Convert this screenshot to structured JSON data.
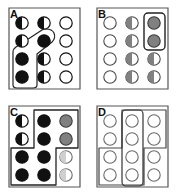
{
  "figure": {
    "width": 176,
    "height": 195,
    "background_color": "#ffffff",
    "panel_count": 4,
    "grid": {
      "rows": 4,
      "cols": 3,
      "circle_radius": 6.2,
      "col_x": [
        22,
        44,
        66
      ],
      "row_y": [
        23,
        41,
        59,
        77
      ]
    },
    "colors": {
      "outline": "#1a1a1a",
      "fill_black": "#111111",
      "fill_gray": "#808080",
      "fill_light_gray": "#cfcfcf",
      "fill_empty": "#ffffff",
      "panel_border": "#555555",
      "highlight_stroke": "#222222"
    }
  },
  "panels": [
    {
      "id": "A",
      "label": "A",
      "cells": [
        {
          "row": 0,
          "col": 0,
          "state": "half-left-black",
          "name": "circle-a-r1c1"
        },
        {
          "row": 0,
          "col": 1,
          "state": "half-left-black",
          "name": "circle-a-r1c2"
        },
        {
          "row": 0,
          "col": 2,
          "state": "empty",
          "name": "circle-a-r1c3"
        },
        {
          "row": 1,
          "col": 0,
          "state": "half-left-black",
          "name": "circle-a-r2c1"
        },
        {
          "row": 1,
          "col": 1,
          "state": "full-black",
          "name": "circle-a-r2c2"
        },
        {
          "row": 1,
          "col": 2,
          "state": "empty",
          "name": "circle-a-r2c3"
        },
        {
          "row": 2,
          "col": 0,
          "state": "full-black",
          "name": "circle-a-r3c1"
        },
        {
          "row": 2,
          "col": 1,
          "state": "half-left-black",
          "name": "circle-a-r3c2"
        },
        {
          "row": 2,
          "col": 2,
          "state": "empty",
          "name": "circle-a-r3c3"
        },
        {
          "row": 3,
          "col": 0,
          "state": "full-black",
          "name": "circle-a-r4c1"
        },
        {
          "row": 3,
          "col": 1,
          "state": "half-left-black",
          "name": "circle-a-r4c2"
        },
        {
          "row": 3,
          "col": 2,
          "state": "empty",
          "name": "circle-a-r4c3"
        }
      ],
      "highlight": {
        "shape": "diagonal-polyline-region",
        "description": "rounded outline running diagonally from row2-col2 down-left to column 1 rows 3-4",
        "points": "52,33 55,37 55,41 33,55 33,85 13,85 13,53 40,34 46,30"
      }
    },
    {
      "id": "B",
      "label": "B",
      "cells": [
        {
          "row": 0,
          "col": 0,
          "state": "empty",
          "name": "circle-b-r1c1"
        },
        {
          "row": 0,
          "col": 1,
          "state": "half-left-gray",
          "name": "circle-b-r1c2"
        },
        {
          "row": 0,
          "col": 2,
          "state": "full-gray",
          "name": "circle-b-r1c3"
        },
        {
          "row": 1,
          "col": 0,
          "state": "empty",
          "name": "circle-b-r2c1"
        },
        {
          "row": 1,
          "col": 1,
          "state": "half-left-gray",
          "name": "circle-b-r2c2"
        },
        {
          "row": 1,
          "col": 2,
          "state": "full-gray",
          "name": "circle-b-r2c3"
        },
        {
          "row": 2,
          "col": 0,
          "state": "empty",
          "name": "circle-b-r3c1"
        },
        {
          "row": 2,
          "col": 1,
          "state": "half-left-gray",
          "name": "circle-b-r3c2"
        },
        {
          "row": 2,
          "col": 2,
          "state": "half-left-gray",
          "name": "circle-b-r3c3"
        },
        {
          "row": 3,
          "col": 0,
          "state": "empty",
          "name": "circle-b-r4c1"
        },
        {
          "row": 3,
          "col": 1,
          "state": "half-left-gray",
          "name": "circle-b-r4c2"
        },
        {
          "row": 3,
          "col": 2,
          "state": "half-left-gray",
          "name": "circle-b-r4c3"
        }
      ],
      "highlight": {
        "shape": "rounded-rect",
        "description": "vertical rounded box around column 3 rows 1-2",
        "x": 56,
        "y": 13,
        "width": 21,
        "height": 37,
        "rx": 4
      }
    },
    {
      "id": "C",
      "label": "C",
      "cells": [
        {
          "row": 0,
          "col": 0,
          "state": "half-left-black",
          "name": "circle-c-r1c1"
        },
        {
          "row": 0,
          "col": 1,
          "state": "full-black",
          "name": "circle-c-r1c2"
        },
        {
          "row": 0,
          "col": 2,
          "state": "full-gray",
          "name": "circle-c-r1c3"
        },
        {
          "row": 1,
          "col": 0,
          "state": "half-left-black",
          "name": "circle-c-r2c1"
        },
        {
          "row": 1,
          "col": 1,
          "state": "full-black",
          "name": "circle-c-r2c2"
        },
        {
          "row": 1,
          "col": 2,
          "state": "full-gray",
          "name": "circle-c-r2c3"
        },
        {
          "row": 2,
          "col": 0,
          "state": "full-black",
          "name": "circle-c-r3c1"
        },
        {
          "row": 2,
          "col": 1,
          "state": "full-black",
          "name": "circle-c-r3c2"
        },
        {
          "row": 2,
          "col": 2,
          "state": "half-left-light",
          "name": "circle-c-r3c3"
        },
        {
          "row": 3,
          "col": 0,
          "state": "full-black",
          "name": "circle-c-r4c1"
        },
        {
          "row": 3,
          "col": 1,
          "state": "full-black",
          "name": "circle-c-r4c2"
        },
        {
          "row": 3,
          "col": 2,
          "state": "half-left-light",
          "name": "circle-c-r4c3"
        }
      ],
      "highlight": {
        "shape": "step-polygon-region",
        "description": "L / step shaped outline covering cols 2-3 rows 1-2 and cols 1-2 rows 3-4",
        "points": "33,13 77,13 77,50 55,50 55,87 12,87 12,50 33,50"
      }
    },
    {
      "id": "D",
      "label": "D",
      "cells": [
        {
          "row": 0,
          "col": 0,
          "state": "empty",
          "name": "circle-d-r1c1"
        },
        {
          "row": 0,
          "col": 1,
          "state": "empty",
          "name": "circle-d-r1c2"
        },
        {
          "row": 0,
          "col": 2,
          "state": "empty",
          "name": "circle-d-r1c3"
        },
        {
          "row": 1,
          "col": 0,
          "state": "empty",
          "name": "circle-d-r2c1"
        },
        {
          "row": 1,
          "col": 1,
          "state": "empty",
          "name": "circle-d-r2c2"
        },
        {
          "row": 1,
          "col": 2,
          "state": "empty",
          "name": "circle-d-r2c3"
        },
        {
          "row": 2,
          "col": 0,
          "state": "empty",
          "name": "circle-d-r3c1"
        },
        {
          "row": 2,
          "col": 1,
          "state": "empty",
          "name": "circle-d-r3c2"
        },
        {
          "row": 2,
          "col": 2,
          "state": "empty",
          "name": "circle-d-r3c3"
        },
        {
          "row": 3,
          "col": 0,
          "state": "empty",
          "name": "circle-d-r4c1"
        },
        {
          "row": 3,
          "col": 1,
          "state": "empty",
          "name": "circle-d-r4c2"
        },
        {
          "row": 3,
          "col": 2,
          "state": "empty",
          "name": "circle-d-r4c3"
        }
      ],
      "highlight": {
        "shape": "column-and-step-region",
        "description": "vertical rounded box around column 2 all rows, plus a step-shaped outline covering cols 2-3 rows 1-2 and cols 1-2 rows 3-4",
        "column_box": {
          "x": 34,
          "y": 12,
          "width": 21,
          "height": 76,
          "rx": 4
        },
        "step_points": "33,12 77,12 77,50 55,50 55,87 12,87 12,50 33,50"
      }
    }
  ]
}
